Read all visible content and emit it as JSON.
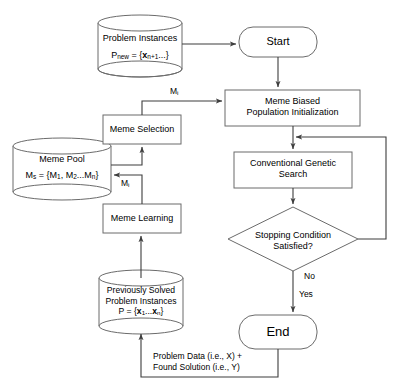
{
  "diagram": {
    "stroke_color": "#4a4a4a",
    "text_color": "#000000",
    "background": "#ffffff"
  },
  "nodes": {
    "problem_instances": {
      "shape": "cylinder",
      "line1": "Problem Instances",
      "line2_prefix": "P",
      "line2_sub": "new",
      "line2_mid": " = {",
      "line2_var": "x",
      "line2_varsub": "n+1",
      "line2_suffix": "...}"
    },
    "start": {
      "shape": "rounded-rect",
      "label": "Start"
    },
    "meme_biased_population_initialization": {
      "shape": "rect",
      "line1": "Meme Biased",
      "line2": "Population Initialization"
    },
    "conventional_genetic_search": {
      "shape": "rect",
      "line1": "Conventional Genetic",
      "line2": "Search"
    },
    "stopping_condition": {
      "shape": "diamond",
      "line1": "Stopping Condition",
      "line2": "Satisfied?"
    },
    "end": {
      "shape": "rounded-rect",
      "label": "End"
    },
    "meme_selection": {
      "shape": "rect",
      "label": "Meme Selection"
    },
    "meme_pool": {
      "shape": "cylinder",
      "line1": "Meme Pool",
      "line2_prefix": "M",
      "line2_sub": "s",
      "line2_mid": " = {M",
      "line2_s1": "1",
      "line2_mid2": ", M",
      "line2_s2": "2",
      "line2_mid3": "...M",
      "line2_s3": "n",
      "line2_suffix": "}"
    },
    "meme_learning": {
      "shape": "rect",
      "label": "Meme Learning"
    },
    "previously_solved": {
      "shape": "cylinder",
      "line1": "Previously Solved",
      "line2": "Problem Instances",
      "line3_prefix": "P = {",
      "line3_v1": "x",
      "line3_s1": "1",
      "line3_mid": "...",
      "line3_v2": "x",
      "line3_s2": "n",
      "line3_suffix": "}"
    }
  },
  "edge_labels": {
    "meme_to_init": {
      "text": "M",
      "sub": "i"
    },
    "learning_to_pool": {
      "text": "M",
      "sub": "i"
    },
    "no": "No",
    "yes": "Yes",
    "feedback_line1": "Problem Data (i.e., X) +",
    "feedback_line2": "Found Solution (i.e., Y)"
  }
}
